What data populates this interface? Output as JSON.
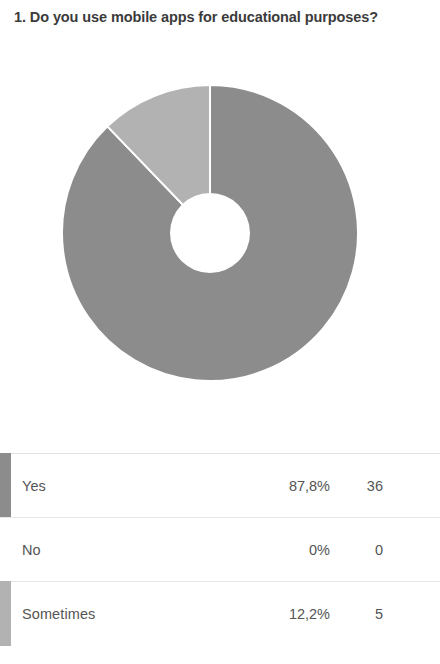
{
  "question": {
    "number": "1.",
    "text": "1. Do you use mobile apps for educational purposes?"
  },
  "colors": {
    "series_yes": "#8c8c8c",
    "series_no": "#cfcfcf",
    "series_sometimes": "#b2b2b2",
    "text": "#555555",
    "title_text": "#3b3b3b",
    "row_divider": "#e6e6e6",
    "background": "#ffffff"
  },
  "table": {
    "rows": [
      {
        "label": "Yes",
        "percent": "87,8%",
        "count": "36",
        "swatch": "#8c8c8c",
        "has_swatch": true
      },
      {
        "label": "No",
        "percent": "0%",
        "count": "0",
        "swatch": "transparent",
        "has_swatch": false
      },
      {
        "label": "Sometimes",
        "percent": "12,2%",
        "count": "5",
        "swatch": "#b2b2b2",
        "has_swatch": true
      }
    ]
  },
  "chart_data": {
    "type": "pie",
    "variant": "donut",
    "title": "1. Do you use mobile apps for educational purposes?",
    "xlabel": "",
    "ylabel": "",
    "legend": "none",
    "grid": false,
    "total_responses": 41,
    "hole_ratio": 0.26,
    "start_angle_deg": 0,
    "direction": "clockwise",
    "categories": [
      "Yes",
      "No",
      "Sometimes"
    ],
    "values": [
      87.8,
      0,
      12.2
    ],
    "counts": [
      36,
      0,
      5
    ],
    "value_labels": [
      "87,8%",
      "0%",
      "12,2%"
    ],
    "colors": [
      "#8c8c8c",
      "#cfcfcf",
      "#b2b2b2"
    ],
    "slices": [
      {
        "label": "Yes",
        "percent": 87.8,
        "count": 36,
        "color": "#8c8c8c",
        "start_deg": 0,
        "end_deg": 316.1
      },
      {
        "label": "No",
        "percent": 0,
        "count": 0,
        "color": "#cfcfcf",
        "start_deg": 316.1,
        "end_deg": 316.1
      },
      {
        "label": "Sometimes",
        "percent": 12.2,
        "count": 5,
        "color": "#b2b2b2",
        "start_deg": 316.1,
        "end_deg": 360
      }
    ]
  }
}
